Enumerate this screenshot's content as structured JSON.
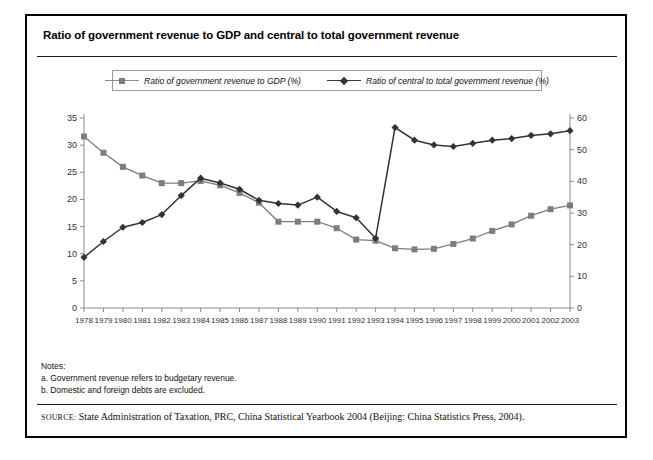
{
  "figure": {
    "title": "Ratio of government revenue to GDP and central to total government revenue",
    "notes_heading": "Notes:",
    "note_a": "a. Government revenue refers to budgetary revenue.",
    "note_b": "b. Domestic and foreign debts are excluded.",
    "source_label": "SOURCE:",
    "source_text": "State Administration of Taxation, PRC, China Statistical Yearbook 2004 (Beijing: China Statistics Press, 2004)."
  },
  "chart_data": {
    "type": "line",
    "title": "Ratio of government revenue to GDP and central to total government revenue",
    "xlabel": "",
    "ylabel": "",
    "grid": false,
    "legend_position": "top-center",
    "categories": [
      "1978",
      "1979",
      "1980",
      "1981",
      "1982",
      "1983",
      "1984",
      "1985",
      "1986",
      "1987",
      "1988",
      "1989",
      "1990",
      "1991",
      "1992",
      "1993",
      "1994",
      "1995",
      "1996",
      "1997",
      "1998",
      "1999",
      "2000",
      "2001",
      "2002",
      "2003"
    ],
    "axes": {
      "left": {
        "label": "",
        "min": 0,
        "max": 35,
        "step": 5,
        "ticks": [
          0,
          5,
          10,
          15,
          20,
          25,
          30,
          35
        ],
        "series": "Ratio of government revenue to GDP (%)"
      },
      "right": {
        "label": "",
        "min": 0,
        "max": 60,
        "step": 10,
        "ticks": [
          0,
          10,
          20,
          30,
          40,
          50,
          60
        ],
        "series": "Ratio of central to total government revenue (%)"
      }
    },
    "series": [
      {
        "name": "Ratio of government revenue to GDP (%)",
        "axis": "left",
        "color": "#7d7d7d",
        "marker": "square",
        "values": [
          31.6,
          28.6,
          26.0,
          24.4,
          23.0,
          23.0,
          23.4,
          22.6,
          21.2,
          19.4,
          15.9,
          15.9,
          15.9,
          14.7,
          12.6,
          12.4,
          11.0,
          10.8,
          10.9,
          11.8,
          12.8,
          14.2,
          15.4,
          17.0,
          18.2,
          18.9
        ]
      },
      {
        "name": "Ratio of central to total government revenue (%)",
        "axis": "right",
        "color": "#333333",
        "marker": "diamond",
        "values": [
          16.0,
          21.0,
          25.5,
          27.0,
          29.5,
          35.5,
          41.0,
          39.5,
          37.5,
          34.0,
          33.0,
          32.5,
          35.0,
          30.5,
          28.5,
          22.0,
          57.0,
          53.0,
          51.5,
          51.0,
          52.0,
          53.0,
          53.5,
          54.5,
          55.0,
          56.0
        ]
      }
    ]
  }
}
